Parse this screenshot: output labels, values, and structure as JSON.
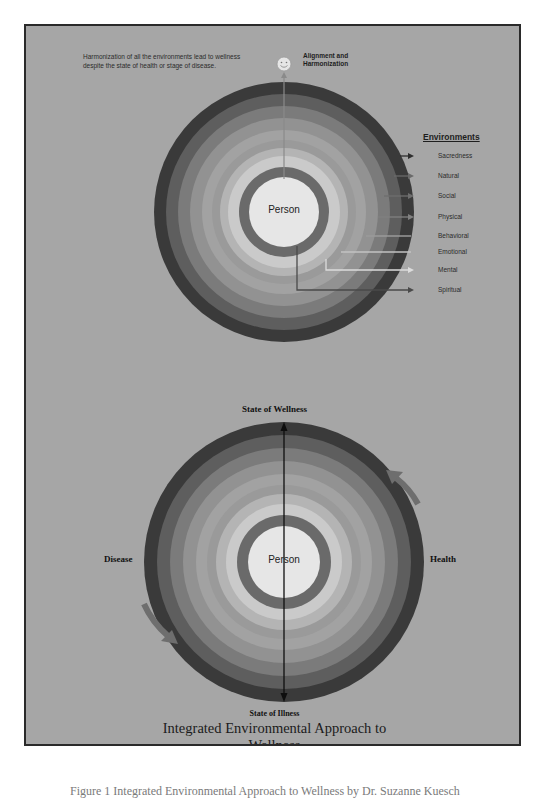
{
  "figure": {
    "title_line1": "Integrated Environmental Approach to",
    "title_line2": "Wellness",
    "caption": "Figure 1 Integrated Environmental Approach to Wellness by Dr. Suzanne Kuesch"
  },
  "top_diagram": {
    "note": "Harmonization of all the environments lead to wellness despite the state of health or stage of disease.",
    "alignment_label_line1": "Alignment and",
    "alignment_label_line2": "Harmonization",
    "smiley_icon": "smiley-face-icon",
    "center_label": "Person",
    "legend_title": "Environments",
    "environments": [
      {
        "label": "Sacredness",
        "color": "#3a3a3a"
      },
      {
        "label": "Natural",
        "color": "#5e5e5e"
      },
      {
        "label": "Social",
        "color": "#7b7b7b"
      },
      {
        "label": "Physical",
        "color": "#929292"
      },
      {
        "label": "Behavioral",
        "color": "#a2a2a2"
      },
      {
        "label": "Emotional",
        "color": "#b4b4b4"
      },
      {
        "label": "Mental",
        "color": "#cacaca"
      },
      {
        "label": "Spiritual",
        "color": "#6a6a6a"
      }
    ]
  },
  "bottom_diagram": {
    "center_label": "Person",
    "top_label": "State of Wellness",
    "bottom_label": "State of  Illness",
    "left_label": "Disease",
    "right_label": "Health"
  },
  "colors": {
    "background": "#a6a6a6",
    "frame_border": "#2a2a2a",
    "ring_outer": "#3a3a3a",
    "center": "#e6e6e6"
  }
}
